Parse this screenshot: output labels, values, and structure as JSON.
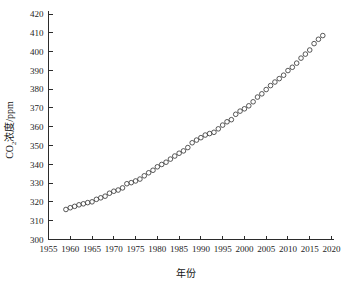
{
  "chart_data": {
    "type": "scatter",
    "title": "",
    "xlabel": "年份",
    "ylabel_main": "CO",
    "ylabel_sub": "2",
    "ylabel_rest": "浓度/ppm",
    "ylabel_full": "CO2浓度/ppm",
    "xlim": [
      1955,
      2020
    ],
    "ylim": [
      300,
      420
    ],
    "xticks": [
      1955,
      1960,
      1965,
      1970,
      1975,
      1980,
      1985,
      1990,
      1995,
      2000,
      2005,
      2010,
      2015,
      2020
    ],
    "yticks": [
      300,
      310,
      320,
      330,
      340,
      350,
      360,
      370,
      380,
      390,
      400,
      410,
      420
    ],
    "grid": false,
    "legend": null,
    "marker": "open-circle",
    "marker_color": "#3a3a3a",
    "x": [
      1959,
      1960,
      1961,
      1962,
      1963,
      1964,
      1965,
      1966,
      1967,
      1968,
      1969,
      1970,
      1971,
      1972,
      1973,
      1974,
      1975,
      1976,
      1977,
      1978,
      1979,
      1980,
      1981,
      1982,
      1983,
      1984,
      1985,
      1986,
      1987,
      1988,
      1989,
      1990,
      1991,
      1992,
      1993,
      1994,
      1995,
      1996,
      1997,
      1998,
      1999,
      2000,
      2001,
      2002,
      2003,
      2004,
      2005,
      2006,
      2007,
      2008,
      2009,
      2010,
      2011,
      2012,
      2013,
      2014,
      2015,
      2016,
      2017,
      2018
    ],
    "values": [
      315.98,
      316.91,
      317.64,
      318.45,
      318.99,
      319.62,
      320.04,
      321.37,
      322.18,
      323.05,
      324.62,
      325.68,
      326.32,
      327.46,
      329.68,
      330.25,
      331.15,
      332.15,
      333.9,
      335.5,
      336.85,
      338.69,
      339.93,
      341.13,
      342.78,
      344.42,
      345.9,
      347.15,
      348.93,
      351.48,
      352.91,
      354.19,
      355.59,
      356.37,
      357.04,
      358.89,
      360.88,
      362.64,
      363.76,
      366.63,
      368.31,
      369.55,
      371.14,
      373.28,
      375.8,
      377.52,
      379.8,
      381.9,
      383.79,
      385.6,
      387.43,
      389.9,
      391.65,
      393.85,
      396.52,
      398.65,
      400.83,
      404.24,
      406.55,
      408.52
    ]
  },
  "accent_color": "#3a3a3a",
  "background_color": "#ffffff"
}
